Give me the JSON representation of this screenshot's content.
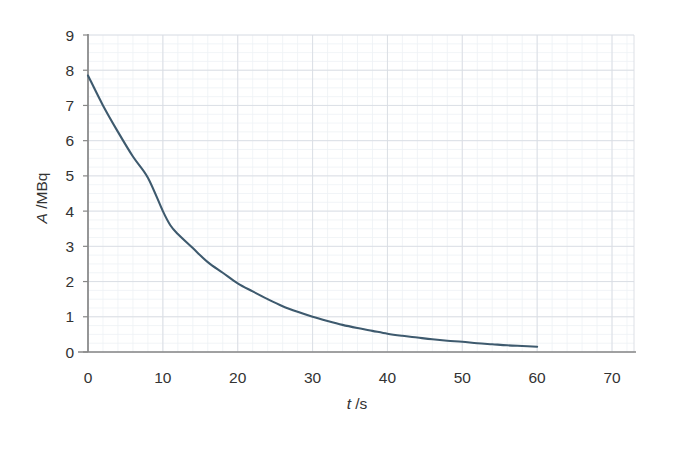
{
  "chart_data": {
    "type": "line",
    "title": "",
    "subtitle": "",
    "xlabel": "t /s",
    "xlabel_italic_part": "t",
    "xlabel_rest": " /s",
    "ylabel": "A /MBq",
    "ylabel_italic_part": "A",
    "ylabel_rest": " /MBq",
    "xlim": [
      0,
      70
    ],
    "ylim": [
      0,
      9
    ],
    "xticks": [
      0,
      10,
      20,
      30,
      40,
      50,
      60,
      70
    ],
    "yticks": [
      0,
      1,
      2,
      3,
      4,
      5,
      6,
      7,
      8,
      9
    ],
    "xtick_labels": [
      "0",
      "10",
      "20",
      "30",
      "40",
      "50",
      "60",
      "70"
    ],
    "ytick_labels": [
      "0",
      "1",
      "2",
      "3",
      "4",
      "5",
      "6",
      "7",
      "8",
      "9"
    ],
    "x_minor_step": 2,
    "y_minor_step": 0.25,
    "grid": true,
    "grid_major_color": "#d9dde3",
    "grid_minor_color": "#eef1f5",
    "axis_color": "#878787",
    "legend": null,
    "legend_position": "none",
    "annotations": [],
    "series": [
      {
        "name": "activity-decay",
        "color": "#3e5a6e",
        "line_width": 2.1,
        "markers": false,
        "x": [
          0,
          2,
          4,
          6,
          8,
          10,
          11,
          12,
          14,
          16,
          18,
          20,
          22,
          24,
          26,
          28,
          30,
          32,
          34,
          36,
          38,
          40,
          42,
          44,
          46,
          48,
          50,
          52,
          54,
          56,
          58,
          60
        ],
        "y": [
          7.85,
          7.0,
          6.25,
          5.55,
          4.95,
          4.0,
          3.6,
          3.35,
          2.95,
          2.55,
          2.25,
          1.95,
          1.72,
          1.5,
          1.3,
          1.14,
          1.0,
          0.88,
          0.77,
          0.68,
          0.6,
          0.52,
          0.46,
          0.41,
          0.36,
          0.32,
          0.29,
          0.25,
          0.22,
          0.19,
          0.17,
          0.15
        ]
      }
    ]
  }
}
